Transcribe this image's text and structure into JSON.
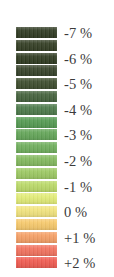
{
  "legend": {
    "title": "",
    "orientation": "vertical",
    "unit": "%",
    "background_color": "#ffffff",
    "label_color": "#3b3b3b",
    "swatch_count": 19,
    "swatch_width_px": 41,
    "swatch_height_px": 11,
    "swatch_gap_px": 1.8,
    "swatches": [
      {
        "index": 0,
        "color": "#2f3a22"
      },
      {
        "index": 1,
        "color": "#323d23"
      },
      {
        "index": 2,
        "color": "#2e3a20"
      },
      {
        "index": 3,
        "color": "#36422a"
      },
      {
        "index": 4,
        "color": "#3d4c2d"
      },
      {
        "index": 5,
        "color": "#44613c"
      },
      {
        "index": 6,
        "color": "#4c7a4a"
      },
      {
        "index": 7,
        "color": "#549a52"
      },
      {
        "index": 8,
        "color": "#63a558"
      },
      {
        "index": 9,
        "color": "#6fae5c"
      },
      {
        "index": 10,
        "color": "#83b95e"
      },
      {
        "index": 11,
        "color": "#9cc862"
      },
      {
        "index": 12,
        "color": "#bad968"
      },
      {
        "index": 13,
        "color": "#e2ec77"
      },
      {
        "index": 14,
        "color": "#f2e47e"
      },
      {
        "index": 15,
        "color": "#f7c96c"
      },
      {
        "index": 16,
        "color": "#f59f66"
      },
      {
        "index": 17,
        "color": "#f2725e"
      },
      {
        "index": 18,
        "color": "#ef5a50"
      }
    ],
    "labels": [
      {
        "text": "-7 %",
        "value": -7,
        "swatch_index": 0
      },
      {
        "text": "-6 %",
        "value": -6,
        "swatch_index": 2
      },
      {
        "text": "-5 %",
        "value": -5,
        "swatch_index": 4
      },
      {
        "text": "-4 %",
        "value": -4,
        "swatch_index": 6
      },
      {
        "text": "-3 %",
        "value": -3,
        "swatch_index": 8
      },
      {
        "text": "-2 %",
        "value": -2,
        "swatch_index": 10
      },
      {
        "text": "-1 %",
        "value": -1,
        "swatch_index": 12
      },
      {
        "text": "0 %",
        "value": 0,
        "swatch_index": 14
      },
      {
        "text": "+1 %",
        "value": 1,
        "swatch_index": 16
      },
      {
        "text": "+2 %",
        "value": 2,
        "swatch_index": 18
      }
    ]
  },
  "chart_data": {
    "type": "heatmap",
    "title": "",
    "subtitle": "",
    "xlabel": "",
    "ylabel": "",
    "legend_position": "standalone",
    "grid": false,
    "colorbar": {
      "orientation": "vertical",
      "unit": "%",
      "range": [
        -7,
        2
      ],
      "tick_labels": [
        "-7 %",
        "-6 %",
        "-5 %",
        "-4 %",
        "-3 %",
        "-2 %",
        "-1 %",
        "0 %",
        "+1 %",
        "+2 %"
      ],
      "tick_values": [
        -7,
        -6,
        -5,
        -4,
        -3,
        -2,
        -1,
        0,
        1,
        2
      ],
      "n_bins": 19,
      "colors": [
        "#2f3a22",
        "#323d23",
        "#2e3a20",
        "#36422a",
        "#3d4c2d",
        "#44613c",
        "#4c7a4a",
        "#549a52",
        "#63a558",
        "#6fae5c",
        "#83b95e",
        "#9cc862",
        "#bad968",
        "#e2ec77",
        "#f2e47e",
        "#f7c96c",
        "#f59f66",
        "#f2725e",
        "#ef5a50"
      ],
      "direction": "negative-dark-green-to-positive-red"
    }
  }
}
